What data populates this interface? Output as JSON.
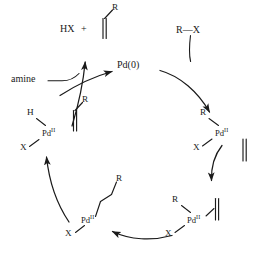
{
  "diagram": {
    "type": "catalytic-cycle",
    "name": "Heck reaction catalytic cycle",
    "direction": "clockwise"
  },
  "species": {
    "catalyst": "Pd(0)",
    "organohalide": "R—X",
    "base": "amine",
    "byproduct_salt": "HX",
    "plus_sign": "+",
    "alkene_free": "alkene",
    "metal_label": "Pd",
    "metal_oxidation_state": "II",
    "ligand_h": "H",
    "ligand_x": "X",
    "ligand_r": "R"
  },
  "nodes": {
    "center": {
      "label": "Pd(0)"
    },
    "oxidative_addition": {
      "r": "R",
      "x": "X",
      "metal": "Pd",
      "state": "II"
    },
    "alkene_complex": {
      "r": "R",
      "x": "X",
      "metal": "Pd",
      "state": "II"
    },
    "insertion_product": {
      "r": "R",
      "x": "X",
      "metal": "Pd",
      "state": "II"
    },
    "hydride_complex": {
      "h": "H",
      "x": "X",
      "metal": "Pd",
      "state": "II",
      "r": "R"
    },
    "product": {
      "hx": "HX",
      "plus": "+",
      "r": "R"
    },
    "reagent_top_right": {
      "label": "R—X"
    },
    "reagent_left": {
      "label": "amine"
    }
  },
  "colors": {
    "ink": "#1a1a1a",
    "background": "#ffffff"
  }
}
